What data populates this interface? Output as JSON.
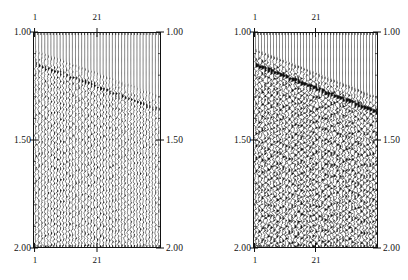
{
  "figure": {
    "type": "seismic-wiggle-panels",
    "background": "#ffffff",
    "ink_color": "#111111",
    "panel_count": 2
  },
  "axes": {
    "time_axis": {
      "label_values": [
        "1.00",
        "1.50",
        "2.00"
      ],
      "min": 1.0,
      "max": 2.0,
      "unit": "s",
      "direction": "increasing-downward",
      "sides": [
        "left",
        "right"
      ],
      "major_step": 0.5,
      "minor_step": 0.1
    },
    "trace_axis": {
      "label_values": [
        "1",
        "21"
      ],
      "min": 1,
      "max": 41,
      "sides": [
        "top",
        "bottom"
      ],
      "tick_count": 41,
      "label_positions": [
        1,
        21
      ]
    }
  },
  "panels": [
    {
      "id": "panel-left",
      "name": "left-seismic-panel",
      "trace_count": 41,
      "top_labels": [
        "1",
        "21"
      ],
      "bottom_labels": [
        "1",
        "21"
      ],
      "left_labels": [
        "1.00",
        "1.50",
        "2.00"
      ],
      "right_labels": [
        "1.00",
        "1.50",
        "2.00"
      ],
      "amplitude_gain": 0.8,
      "fill_density": 0.62,
      "seed": 17,
      "events": [
        {
          "name": "dipping-reflector-primary",
          "t_start": 1.085,
          "t_end": 1.295,
          "strength": 1.0
        },
        {
          "name": "dipping-reflector-secondary",
          "t_start": 1.145,
          "t_end": 1.36,
          "strength": 0.7
        }
      ]
    },
    {
      "id": "panel-right",
      "name": "right-seismic-panel",
      "trace_count": 41,
      "top_labels": [
        "1",
        "21"
      ],
      "bottom_labels": [
        "1",
        "21"
      ],
      "left_labels": [
        "1.00",
        "1.50",
        "2.00"
      ],
      "right_labels": [
        "1.00",
        "1.50",
        "2.00"
      ],
      "amplitude_gain": 1.15,
      "fill_density": 0.86,
      "seed": 43,
      "events": [
        {
          "name": "dipping-reflector-primary",
          "t_start": 1.08,
          "t_end": 1.3,
          "strength": 1.0
        },
        {
          "name": "dipping-reflector-secondary",
          "t_start": 1.15,
          "t_end": 1.37,
          "strength": 0.85
        }
      ]
    }
  ],
  "chart_data": {
    "type": "line",
    "title": "",
    "xlabel": "",
    "ylabel": "",
    "subtitle": "",
    "grid": false,
    "legend": "none",
    "xlim": [
      1,
      41
    ],
    "ylim": [
      1.0,
      2.0
    ],
    "x_tick_labels": [
      "1",
      "21"
    ],
    "y_tick_labels": [
      "1.00",
      "1.50",
      "2.00"
    ],
    "series": [
      {
        "name": "left-panel-traces",
        "trace_count": 41,
        "time_range": [
          1.0,
          2.0
        ],
        "values": [
          0.8
        ]
      },
      {
        "name": "right-panel-traces",
        "trace_count": 41,
        "time_range": [
          1.0,
          2.0
        ],
        "values": [
          1.15
        ]
      }
    ]
  }
}
